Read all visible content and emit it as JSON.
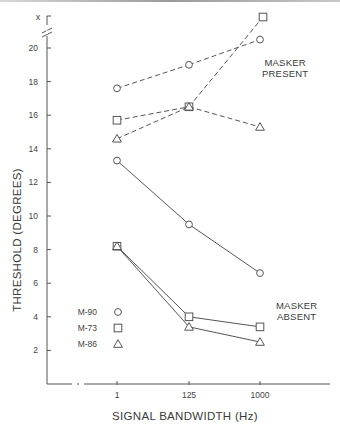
{
  "chart_data": {
    "type": "line",
    "title": "",
    "xlabel": "SIGNAL BANDWIDTH (Hz)",
    "ylabel": "THRESHOLD (DEGREES)",
    "categories": [
      "1",
      "125",
      "1000"
    ],
    "yticks": [
      2,
      4,
      6,
      8,
      10,
      12,
      14,
      16,
      18,
      20
    ],
    "ytick_extra": "x",
    "ylim": [
      0,
      21
    ],
    "axis_break": "y-axis break between 20 and x; x-axis break near origin",
    "grid": false,
    "legend_position": "lower-left inside plot",
    "legend": [
      {
        "name": "M-90",
        "marker": "circle"
      },
      {
        "name": "M-73",
        "marker": "square"
      },
      {
        "name": "M-86",
        "marker": "triangle"
      }
    ],
    "annotations": [
      "MASKER PRESENT",
      "MASKER ABSENT"
    ],
    "series": [
      {
        "name": "M-90",
        "condition": "MASKER PRESENT",
        "marker": "circle",
        "style": "dashed",
        "values": [
          17.6,
          19.0,
          20.5
        ]
      },
      {
        "name": "M-73",
        "condition": "MASKER PRESENT",
        "marker": "square",
        "style": "dashed",
        "values": [
          15.7,
          16.5,
          "x (off-scale)"
        ]
      },
      {
        "name": "M-86",
        "condition": "MASKER PRESENT",
        "marker": "triangle",
        "style": "dashed",
        "values": [
          14.6,
          16.5,
          15.3
        ]
      },
      {
        "name": "M-90",
        "condition": "MASKER ABSENT",
        "marker": "circle",
        "style": "solid",
        "values": [
          13.3,
          9.5,
          6.6
        ]
      },
      {
        "name": "M-73",
        "condition": "MASKER ABSENT",
        "marker": "square",
        "style": "solid",
        "values": [
          8.2,
          4.0,
          3.4
        ]
      },
      {
        "name": "M-86",
        "condition": "MASKER ABSENT",
        "marker": "triangle",
        "style": "solid",
        "values": [
          8.2,
          3.4,
          2.5
        ]
      }
    ]
  },
  "labels": {
    "x_axis": "SIGNAL BANDWIDTH (Hz)",
    "y_axis": "THRESHOLD (DEGREES)",
    "masker_present": [
      "MASKER",
      "PRESENT"
    ],
    "masker_absent": [
      "MASKER",
      "ABSENT"
    ],
    "x_off_scale": "x",
    "legend": [
      "M-90",
      "M-73",
      "M-86"
    ]
  }
}
